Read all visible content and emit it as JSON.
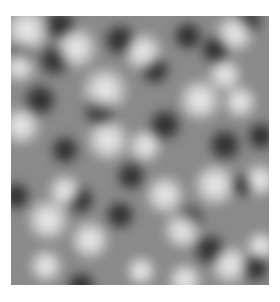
{
  "image": {
    "description": "Grayscale blurred random noise texture (Gaussian random field)",
    "frame": {
      "x": 11,
      "y": 16,
      "width": 258,
      "height": 269
    },
    "base_gray": "#8a8a8a",
    "light_color": "#f2f2f2",
    "dark_color": "#1e1e1e",
    "light_blobs": [
      [
        16,
        14,
        22
      ],
      [
        65,
        32,
        20
      ],
      [
        132,
        36,
        18
      ],
      [
        224,
        17,
        18
      ],
      [
        8,
        50,
        16
      ],
      [
        94,
        74,
        22
      ],
      [
        189,
        84,
        20
      ],
      [
        214,
        59,
        16
      ],
      [
        10,
        110,
        18
      ],
      [
        97,
        124,
        20
      ],
      [
        134,
        130,
        16
      ],
      [
        229,
        86,
        16
      ],
      [
        37,
        204,
        20
      ],
      [
        79,
        224,
        18
      ],
      [
        204,
        169,
        20
      ],
      [
        172,
        214,
        18
      ],
      [
        219,
        249,
        18
      ],
      [
        174,
        264,
        16
      ],
      [
        154,
        179,
        18
      ],
      [
        249,
        164,
        16
      ],
      [
        54,
        175,
        16
      ],
      [
        130,
        255,
        14
      ],
      [
        35,
        250,
        16
      ],
      [
        250,
        230,
        14
      ]
    ],
    "dark_blobs": [
      [
        49,
        9,
        16
      ],
      [
        109,
        24,
        16
      ],
      [
        177,
        20,
        14
      ],
      [
        237,
        5,
        14
      ],
      [
        9,
        39,
        14
      ],
      [
        44,
        44,
        16
      ],
      [
        144,
        54,
        14
      ],
      [
        204,
        34,
        14
      ],
      [
        29,
        84,
        16
      ],
      [
        89,
        94,
        16
      ],
      [
        154,
        109,
        16
      ],
      [
        214,
        129,
        16
      ],
      [
        54,
        134,
        14
      ],
      [
        179,
        204,
        14
      ],
      [
        232,
        169,
        12
      ],
      [
        199,
        234,
        16
      ],
      [
        244,
        252,
        14
      ],
      [
        109,
        199,
        14
      ],
      [
        69,
        184,
        14
      ],
      [
        120,
        160,
        14
      ],
      [
        70,
        270,
        14
      ],
      [
        5,
        180,
        14
      ],
      [
        250,
        120,
        14
      ]
    ]
  }
}
